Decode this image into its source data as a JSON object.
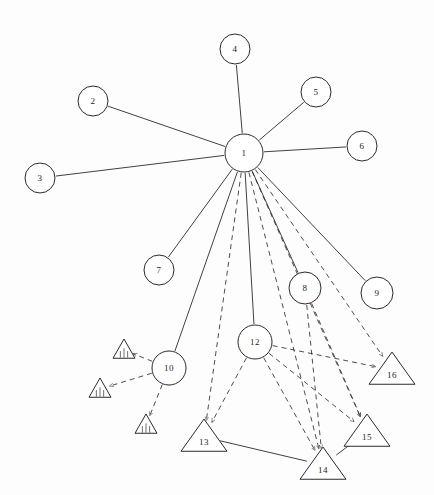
{
  "diagram": {
    "background_color": "#fdfdfd",
    "stroke_color": "#2b2b2b",
    "dashed_stroke_color": "#3a3a3a",
    "width": 434,
    "height": 495
  },
  "nodes": [
    {
      "id": "1",
      "label": "1",
      "shape": "circle",
      "cx": 244,
      "cy": 153,
      "r": 19
    },
    {
      "id": "2",
      "label": "2",
      "shape": "circle",
      "cx": 93,
      "cy": 101,
      "r": 15
    },
    {
      "id": "3",
      "label": "3",
      "shape": "circle",
      "cx": 40,
      "cy": 178,
      "r": 15
    },
    {
      "id": "4",
      "label": "4",
      "shape": "circle",
      "cx": 235,
      "cy": 49,
      "r": 15
    },
    {
      "id": "5",
      "label": "5",
      "shape": "circle",
      "cx": 316,
      "cy": 92,
      "r": 15
    },
    {
      "id": "6",
      "label": "6",
      "shape": "circle",
      "cx": 362,
      "cy": 146,
      "r": 15
    },
    {
      "id": "7",
      "label": "7",
      "shape": "circle",
      "cx": 159,
      "cy": 270,
      "r": 15
    },
    {
      "id": "8",
      "label": "8",
      "shape": "circle",
      "cx": 305,
      "cy": 288,
      "r": 16
    },
    {
      "id": "9",
      "label": "9",
      "shape": "circle",
      "cx": 377,
      "cy": 293,
      "r": 16
    },
    {
      "id": "10",
      "label": "10",
      "shape": "circle",
      "cx": 169,
      "cy": 368,
      "r": 17
    },
    {
      "id": "12",
      "label": "12",
      "shape": "circle",
      "cx": 255,
      "cy": 342,
      "r": 17
    },
    {
      "id": "13",
      "label": "13",
      "shape": "triangle",
      "cx": 204,
      "cy": 437,
      "size": 23
    },
    {
      "id": "14",
      "label": "14",
      "shape": "triangle",
      "cx": 323,
      "cy": 465,
      "size": 23
    },
    {
      "id": "15",
      "label": "15",
      "shape": "triangle",
      "cx": 367,
      "cy": 432,
      "size": 23
    },
    {
      "id": "16",
      "label": "16",
      "shape": "triangle",
      "cx": 392,
      "cy": 370,
      "size": 23
    }
  ],
  "warning_markers": [
    {
      "id": "w1",
      "cx": 124,
      "cy": 350,
      "size": 11
    },
    {
      "id": "w2",
      "cx": 100,
      "cy": 389,
      "size": 11
    },
    {
      "id": "w3",
      "cx": 146,
      "cy": 425,
      "size": 11
    }
  ],
  "edges_solid": [
    {
      "from": "1",
      "to": "2"
    },
    {
      "from": "1",
      "to": "3"
    },
    {
      "from": "1",
      "to": "4"
    },
    {
      "from": "1",
      "to": "5"
    },
    {
      "from": "1",
      "to": "6"
    },
    {
      "from": "1",
      "to": "7"
    },
    {
      "from": "1",
      "to": "8"
    },
    {
      "from": "1",
      "to": "9"
    },
    {
      "from": "1",
      "to": "10"
    },
    {
      "from": "1",
      "to": "12"
    },
    {
      "from": "13",
      "to": "14"
    },
    {
      "from": "14",
      "to": "15"
    }
  ],
  "edges_dashed": [
    {
      "from": "1",
      "to": "13"
    },
    {
      "from": "1",
      "to": "14"
    },
    {
      "from": "1",
      "to": "15"
    },
    {
      "from": "1",
      "to": "16"
    },
    {
      "from": "12",
      "to": "13"
    },
    {
      "from": "12",
      "to": "14"
    },
    {
      "from": "12",
      "to": "15"
    },
    {
      "from": "12",
      "to": "16"
    },
    {
      "from": "10",
      "to": "w1"
    },
    {
      "from": "10",
      "to": "w2"
    },
    {
      "from": "10",
      "to": "w3"
    },
    {
      "from": "8",
      "to": "15"
    },
    {
      "from": "8",
      "to": "14"
    }
  ],
  "legend": {
    "circle_meaning": "circle-node",
    "triangle_meaning": "triangle-node",
    "warning_meaning": "warning-marker",
    "solid_meaning": "solid-link",
    "dashed_meaning": "dashed-link"
  }
}
